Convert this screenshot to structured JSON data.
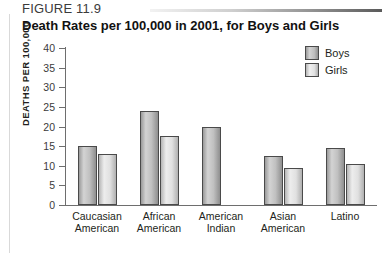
{
  "figure": {
    "number": "FIGURE 11.9",
    "title": "Death Rates per 100,000 in 2001, for Boys and Girls"
  },
  "chart_data": {
    "type": "bar",
    "title": "Death Rates per 100,000 in 2001, for Boys and Girls",
    "xlabel": "",
    "ylabel": "DEATHS PER 100,000",
    "ylim": [
      0,
      40
    ],
    "ytick_step": 5,
    "yticks": [
      40,
      35,
      30,
      25,
      20,
      15,
      10,
      5,
      0
    ],
    "grid": false,
    "legend_position": "top-right",
    "categories": [
      "Caucasian American",
      "African American",
      "American Indian",
      "Asian American",
      "Latino"
    ],
    "category_lines": [
      [
        "Caucasian",
        "American"
      ],
      [
        "African",
        "American"
      ],
      [
        "American",
        "Indian"
      ],
      [
        "Asian",
        "American"
      ],
      [
        "Latino",
        ""
      ]
    ],
    "series": [
      {
        "name": "Boys",
        "color": "#c0c0c0",
        "values": [
          15,
          24,
          20,
          12.5,
          14.5
        ]
      },
      {
        "name": "Girls",
        "color": "#e4e4e4",
        "values": [
          13,
          17.5,
          null,
          9.5,
          10.5
        ]
      }
    ]
  }
}
